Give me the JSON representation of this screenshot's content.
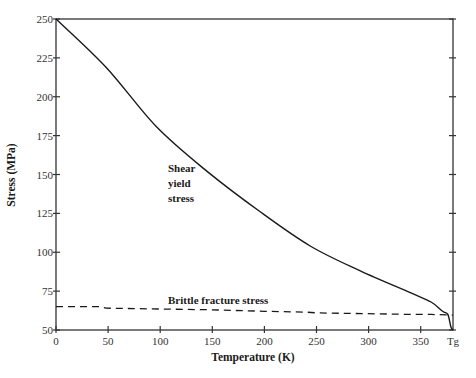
{
  "chart_data": {
    "type": "line",
    "title": "",
    "xlabel": "Temperature (K)",
    "ylabel": "Stress (MPa)",
    "xlim": [
      0,
      381
    ],
    "ylim": [
      50,
      250
    ],
    "x_ticks": [
      0,
      50,
      100,
      150,
      200,
      250,
      300,
      350
    ],
    "x_tick_labels": [
      "0",
      "50",
      "100",
      "150",
      "200",
      "250",
      "300",
      "350"
    ],
    "x_end_label": "Tg",
    "x_end_value": 381,
    "y_ticks": [
      50,
      75,
      100,
      125,
      150,
      175,
      200,
      225,
      250
    ],
    "y_tick_labels": [
      "50",
      "75",
      "100",
      "125",
      "150",
      "175",
      "200",
      "225",
      "250"
    ],
    "grid": false,
    "legend": "none (inline annotations)",
    "series": [
      {
        "name": "Shear yield stress",
        "style": "solid",
        "x": [
          0,
          48,
          96,
          145,
          196,
          244,
          292,
          340,
          360,
          371,
          376,
          379,
          381
        ],
        "y": [
          250,
          219,
          181,
          152,
          126,
          104,
          88,
          74,
          68,
          62,
          60,
          52,
          50
        ]
      },
      {
        "name": "Brittle fracture stress",
        "style": "dashed",
        "x": [
          0,
          42,
          48,
          100,
          150,
          200,
          240,
          250,
          300,
          340,
          360,
          381
        ],
        "y": [
          65,
          65,
          64,
          63.5,
          63,
          62,
          61.5,
          61,
          60.5,
          60,
          60,
          59.5
        ]
      }
    ],
    "annotations": [
      {
        "lines": [
          "Shear",
          "yield",
          "stress"
        ],
        "x": 105,
        "y": 160
      },
      {
        "text": "Brittle fracture stress",
        "x": 108,
        "y": 70
      }
    ]
  },
  "labels": {
    "xlabel": "Temperature (K)",
    "ylabel": "Stress (MPa)",
    "tg": "Tg",
    "shear_1": "Shear",
    "shear_2": "yield",
    "shear_3": "stress",
    "brittle": "Brittle fracture stress"
  }
}
